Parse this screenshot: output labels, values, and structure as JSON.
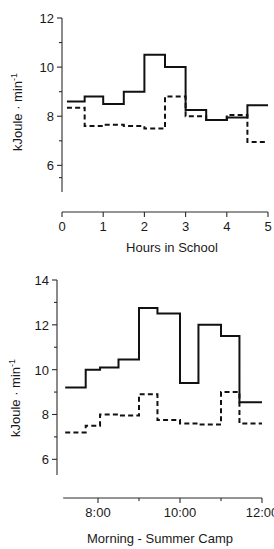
{
  "figure": {
    "title": "",
    "background": "#ffffff",
    "line_color": "#111111"
  },
  "chart_data": [
    {
      "id": "school",
      "type": "line",
      "title": "",
      "subtitle": "",
      "xlabel": "Hours in School",
      "ylabel": "kJoule · min",
      "ylabel_exponent": "-1",
      "xlim": [
        0,
        5
      ],
      "ylim": [
        5.2,
        12
      ],
      "xticks": [
        0,
        1,
        2,
        3,
        4,
        5
      ],
      "xticklabels": [
        "0",
        "1",
        "2",
        "3",
        "4",
        "5"
      ],
      "yticks": [
        6,
        8,
        10,
        12
      ],
      "yticklabels": [
        "6",
        "8",
        "10",
        "12"
      ],
      "yminorticks": [
        5.5,
        7,
        9,
        11
      ],
      "grid": false,
      "legend": "none",
      "step_mode": "post",
      "series": [
        {
          "name": "solid",
          "style": "solid",
          "x": [
            0.12,
            0.55,
            1.0,
            1.5,
            2.0,
            2.5,
            3.0,
            3.5,
            4.0,
            4.5,
            5.0
          ],
          "values": [
            8.6,
            8.8,
            8.5,
            9.0,
            10.5,
            10.0,
            8.25,
            7.85,
            7.95,
            8.45,
            8.45
          ]
        },
        {
          "name": "dashed",
          "style": "dashed",
          "x": [
            0.12,
            0.55,
            1.0,
            1.5,
            2.0,
            2.5,
            3.0,
            3.5,
            4.0,
            4.5,
            5.0
          ],
          "values": [
            8.35,
            7.6,
            7.65,
            7.6,
            7.5,
            8.8,
            8.0,
            7.85,
            8.05,
            6.95,
            6.95
          ]
        }
      ]
    },
    {
      "id": "summer-camp",
      "type": "line",
      "title": "",
      "subtitle": "",
      "xlabel": "Morning - Summer Camp",
      "ylabel": "kJoule · min",
      "ylabel_exponent": "-1",
      "xlim": [
        7.0,
        12.0
      ],
      "ylim": [
        5.3,
        14
      ],
      "xticks": [
        8,
        10,
        12
      ],
      "xticklabels": [
        "8:00",
        "10:00",
        "12:00"
      ],
      "xminorticks": [
        9,
        11
      ],
      "yticks": [
        6,
        8,
        10,
        12,
        14
      ],
      "yticklabels": [
        "6",
        "8",
        "10",
        "12",
        "14"
      ],
      "yminorticks": [
        7,
        9,
        11,
        13
      ],
      "grid": false,
      "legend": "none",
      "step_mode": "post",
      "series": [
        {
          "name": "solid",
          "style": "solid",
          "x": [
            7.2,
            7.7,
            8.05,
            8.5,
            9.0,
            9.45,
            10.0,
            10.45,
            11.0,
            11.45,
            12.0
          ],
          "values": [
            9.2,
            10.0,
            10.1,
            10.45,
            12.75,
            12.5,
            9.4,
            12.0,
            11.5,
            8.55,
            8.55
          ]
        },
        {
          "name": "dashed",
          "style": "dashed",
          "x": [
            7.2,
            7.7,
            8.05,
            8.5,
            9.0,
            9.45,
            10.0,
            10.45,
            11.0,
            11.45,
            12.0
          ],
          "values": [
            7.2,
            7.5,
            8.0,
            7.95,
            8.9,
            7.75,
            7.6,
            7.55,
            9.0,
            7.6,
            7.6
          ]
        }
      ]
    }
  ]
}
